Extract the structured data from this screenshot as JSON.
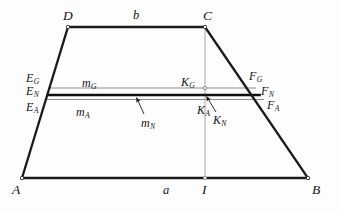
{
  "figure": {
    "type": "geometry-diagram",
    "colors": {
      "background": "#fdfdfd",
      "outline": "#1a1a1a",
      "thin_line": "#8c8c8c",
      "bold_line": "#111111",
      "label": "#141414",
      "vertex_marker_fill": "#ffffff"
    }
  },
  "vertices": {
    "A": {
      "label": "A",
      "x": 22,
      "y": 178
    },
    "B": {
      "label": "B",
      "x": 308,
      "y": 178
    },
    "C": {
      "label": "C",
      "x": 205,
      "y": 27
    },
    "D": {
      "label": "D",
      "x": 68,
      "y": 27
    },
    "I": {
      "label": "I",
      "x": 205,
      "y": 178
    }
  },
  "side_labels": {
    "top": "b",
    "bottom": "a"
  },
  "mean_lines": [
    {
      "name": "m_G",
      "label_base": "m",
      "label_sub": "G",
      "y": 88,
      "x_left": 48.4,
      "x_right": 256.0,
      "style": "thin",
      "left_point": {
        "base": "E",
        "sub": "G"
      },
      "mid_point": {
        "base": "K",
        "sub": "G"
      },
      "right_point": {
        "base": "F",
        "sub": "G"
      }
    },
    {
      "name": "m_N",
      "label_base": "m",
      "label_sub": "N",
      "y": 95,
      "x_left": 46.3,
      "x_right": 260.8,
      "style": "bold",
      "left_point": {
        "base": "E",
        "sub": "N"
      },
      "mid_point": {
        "base": "K",
        "sub": "N"
      },
      "right_point": {
        "base": "F",
        "sub": "N"
      }
    },
    {
      "name": "m_A",
      "label_base": "m",
      "label_sub": "A",
      "y": 99.5,
      "x_left": 44.9,
      "x_right": 263.8,
      "style": "thin",
      "left_point": {
        "base": "E",
        "sub": "A"
      },
      "mid_point": {
        "base": "K",
        "sub": "A"
      },
      "right_point": {
        "base": "F",
        "sub": "A"
      }
    }
  ],
  "vertical_line": {
    "name": "CI",
    "from": "C",
    "to": "I",
    "x": 205,
    "y_top": 27,
    "y_bottom": 178,
    "style": "thin"
  },
  "point_labels": {
    "E_G": {
      "base": "E",
      "sub": "G",
      "left": 26,
      "top": 72
    },
    "E_N": {
      "base": "E",
      "sub": "N",
      "left": 26,
      "top": 85
    },
    "E_A": {
      "base": "E",
      "sub": "A",
      "left": 26,
      "top": 101
    },
    "K_G": {
      "base": "K",
      "sub": "G",
      "left": 181,
      "top": 76
    },
    "K_A": {
      "base": "K",
      "sub": "A",
      "left": 197,
      "top": 104
    },
    "K_N": {
      "base": "K",
      "sub": "N",
      "left": 213,
      "top": 114
    },
    "F_G": {
      "base": "F",
      "sub": "G",
      "left": 249,
      "top": 70
    },
    "F_N": {
      "base": "F",
      "sub": "N",
      "left": 261,
      "top": 85
    },
    "F_A": {
      "base": "F",
      "sub": "A",
      "left": 267,
      "top": 99
    }
  },
  "mean_line_labels": {
    "m_G": {
      "base": "m",
      "sub": "G",
      "left": 82,
      "top": 77
    },
    "m_A": {
      "base": "m",
      "sub": "A",
      "left": 76,
      "top": 106
    },
    "m_N": {
      "base": "m",
      "sub": "N",
      "left": 141,
      "top": 117
    }
  },
  "vertex_labels": {
    "A": {
      "text": "A",
      "left": 12,
      "top": 183
    },
    "B": {
      "text": "B",
      "left": 312,
      "top": 183
    },
    "C": {
      "text": "C",
      "left": 203,
      "top": 9
    },
    "D": {
      "text": "D",
      "left": 63,
      "top": 9
    },
    "I": {
      "text": "I",
      "left": 202,
      "top": 183
    },
    "b": {
      "text": "b",
      "left": 133,
      "top": 9
    },
    "a": {
      "text": "a",
      "left": 163,
      "top": 184
    }
  },
  "leader_arrows": [
    {
      "name": "m_N-leader",
      "from_x": 144,
      "from_y": 114,
      "to_x": 136,
      "to_y": 97
    },
    {
      "name": "K_N-leader",
      "from_x": 216,
      "from_y": 112,
      "to_x": 206,
      "to_y": 96
    }
  ]
}
